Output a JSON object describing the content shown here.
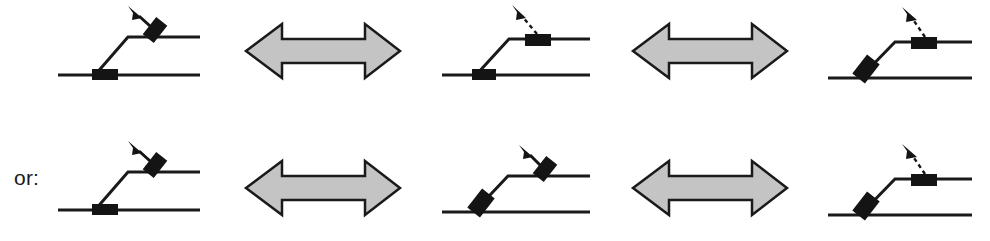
{
  "figure": {
    "background_color": "#ffffff",
    "line_color": "#1a1a1a",
    "block_color": "#141414",
    "arrow_fill": "#c4c4c4",
    "arrow_stroke": "#1a1a1a",
    "rows": [
      {
        "row_id": "row-top",
        "label": "",
        "panels": [
          {
            "panel_id": "panel-top-1",
            "block_position": "ramp-bottom",
            "block_orientation": "horizontal",
            "force_arrow": "solid-short-up-left",
            "force_arrow_location": "upper-level",
            "force_block_orientation": "tilted"
          },
          {
            "panel_id": "panel-top-2",
            "block_position": "ramp-bottom",
            "block_orientation": "horizontal",
            "force_arrow": "dashed-long-up-left",
            "force_arrow_location": "upper-level",
            "force_block_orientation": "horizontal"
          },
          {
            "panel_id": "panel-top-3",
            "block_position": "ramp-slope",
            "block_orientation": "tilted",
            "force_arrow": "dashed-long-up-left",
            "force_arrow_location": "upper-level",
            "force_block_orientation": "horizontal"
          }
        ],
        "connectors": [
          {
            "connector_id": "connector-top-1",
            "symbol": "double-headed-arrow",
            "meaning": "equivalent-to"
          },
          {
            "connector_id": "connector-top-2",
            "symbol": "double-headed-arrow",
            "meaning": "equivalent-to"
          }
        ]
      },
      {
        "row_id": "row-bottom",
        "label": "or:",
        "panels": [
          {
            "panel_id": "panel-bottom-1",
            "block_position": "ramp-bottom",
            "block_orientation": "horizontal",
            "force_arrow": "solid-short-up-left",
            "force_arrow_location": "upper-level",
            "force_block_orientation": "tilted"
          },
          {
            "panel_id": "panel-bottom-2",
            "block_position": "ramp-slope",
            "block_orientation": "tilted",
            "force_arrow": "solid-short-up-left",
            "force_arrow_location": "upper-level",
            "force_block_orientation": "tilted"
          },
          {
            "panel_id": "panel-bottom-3",
            "block_position": "ramp-slope",
            "block_orientation": "tilted",
            "force_arrow": "dashed-long-up-left",
            "force_arrow_location": "upper-level",
            "force_block_orientation": "horizontal"
          }
        ],
        "connectors": [
          {
            "connector_id": "connector-bottom-1",
            "symbol": "double-headed-arrow",
            "meaning": "equivalent-to"
          },
          {
            "connector_id": "connector-bottom-2",
            "symbol": "double-headed-arrow",
            "meaning": "equivalent-to"
          }
        ]
      }
    ]
  },
  "labels": {
    "or_text": "or:"
  }
}
